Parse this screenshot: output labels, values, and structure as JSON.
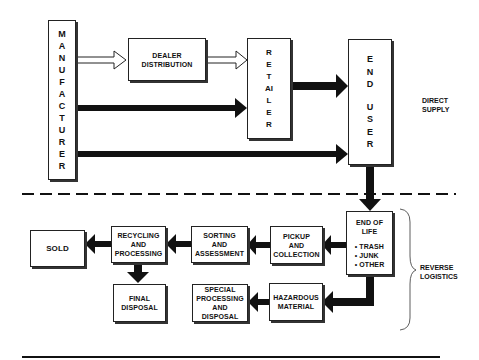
{
  "diagram": {
    "direct_supply": {
      "section_label": "DIRECT\nSUPPLY",
      "manufacturer": "MANUFACTURER",
      "dealer_distribution": "DEALER\nDISTRIBUTION",
      "retailer": "RETAILER",
      "end_user_line1": "END",
      "end_user_line2": "USER"
    },
    "reverse_logistics": {
      "section_label": "REVERSE\nLOGISTICS",
      "end_of_life": {
        "title": "END OF\nLIFE",
        "items": [
          "• TRASH",
          "• JUNK",
          "• OTHER"
        ]
      },
      "pickup": "PICKUP\nAND\nCOLLECTION",
      "sorting": "SORTING\nAND\nASSESSMENT",
      "recycling": "RECYCLING\nAND\nPROCESSING",
      "sold": "SOLD",
      "final_disposal": "FINAL\nDISPOSAL",
      "hazardous": "HAZARDOUS\nMATERIAL",
      "special_processing": "SPECIAL\nPROCESSING\nAND DISPOSAL"
    },
    "colors": {
      "line": "#111111",
      "box_border": "#222222",
      "background": "#ffffff"
    }
  }
}
